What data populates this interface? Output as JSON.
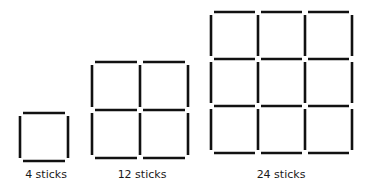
{
  "figures": [
    {
      "label": "4 sticks",
      "grid": 1,
      "origin": [
        20,
        113
      ],
      "cell": 48,
      "label_x": 46
    },
    {
      "label": "12 sticks",
      "grid": 2,
      "origin": [
        92,
        62
      ],
      "cell": 48,
      "label_x": 142
    },
    {
      "label": "24 sticks",
      "grid": 3,
      "origin": [
        211,
        12
      ],
      "cell": 47,
      "label_x": 281
    }
  ],
  "style": {
    "stick_color": "#111111",
    "stick_width": 2.6,
    "gap": 3
  }
}
